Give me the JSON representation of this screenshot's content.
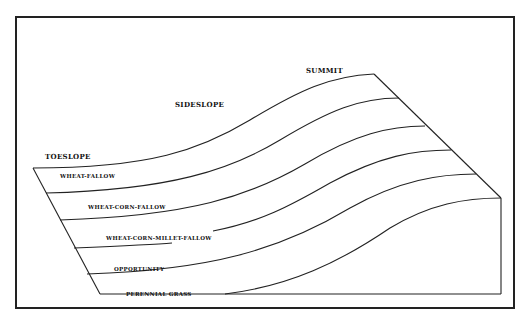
{
  "diagram": {
    "type": "landscape-cross-section",
    "position_labels": {
      "summit": "SUMMIT",
      "sideslope": "SIDESLOPE",
      "toeslope": "TOESLOPE"
    },
    "zones": [
      {
        "label": "WHEAT-FALLOW"
      },
      {
        "label": "WHEAT-CORN-FALLOW"
      },
      {
        "label": "WHEAT-CORN-MILLET-FALLOW"
      },
      {
        "label": "OPPORTUNITY"
      },
      {
        "label": "PERENNIAL GRASS"
      }
    ],
    "colors": {
      "line": "#222222",
      "background": "#ffffff"
    }
  }
}
